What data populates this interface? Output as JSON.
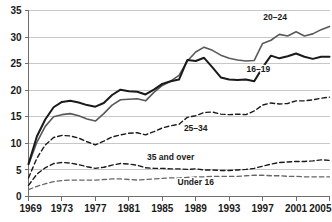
{
  "chart_data": {
    "type": "line",
    "title": "",
    "subtitle": "",
    "xlabel": "",
    "ylabel": "",
    "xlim": [
      1969,
      2005
    ],
    "ylim": [
      0,
      35
    ],
    "ytick_step": 5,
    "xtick_step": 4,
    "grid": true,
    "legend_position": "inline-annotations",
    "yticks": [
      "0",
      "5",
      "10",
      "15",
      "20",
      "25",
      "30",
      "35"
    ],
    "ytick_values": [
      0,
      5,
      10,
      15,
      20,
      25,
      30,
      35
    ],
    "xticks": [
      "1969",
      "1973",
      "1977",
      "1981",
      "1985",
      "1989",
      "1993",
      "1997",
      "2001",
      "2005"
    ],
    "xtick_values": [
      1969,
      1973,
      1977,
      1981,
      1985,
      1989,
      1993,
      1997,
      2001,
      2005
    ],
    "x": [
      1969,
      1970,
      1971,
      1972,
      1973,
      1974,
      1975,
      1976,
      1977,
      1978,
      1979,
      1980,
      1981,
      1982,
      1983,
      1984,
      1985,
      1986,
      1987,
      1988,
      1989,
      1990,
      1991,
      1992,
      1993,
      1994,
      1995,
      1996,
      1997,
      1998,
      1999,
      2000,
      2001,
      2002,
      2003,
      2004,
      2005
    ],
    "series": [
      {
        "name": "20–24",
        "label": "20–24",
        "style": "solid",
        "color": "#595959",
        "width": 1.6,
        "label_x": 1998.5,
        "label_y": 33.3,
        "values": [
          6.0,
          10.2,
          13.2,
          15.0,
          15.4,
          15.6,
          15.2,
          14.6,
          14.2,
          15.6,
          17.2,
          18.2,
          18.3,
          18.4,
          18.0,
          19.6,
          20.9,
          21.7,
          22.8,
          25.5,
          27.2,
          28.1,
          27.5,
          26.6,
          26.0,
          25.7,
          25.5,
          25.6,
          28.8,
          29.4,
          30.5,
          30.2,
          31.0,
          30.2,
          30.6,
          31.4,
          32.0
        ]
      },
      {
        "name": "16–19",
        "label": "16–19",
        "style": "solid",
        "color": "#1a1a1a",
        "width": 2.0,
        "label_x": 1996.5,
        "label_y": 23.4,
        "values": [
          6.1,
          11.3,
          14.5,
          16.8,
          17.8,
          18.0,
          17.7,
          17.2,
          16.9,
          17.6,
          19.1,
          20.1,
          19.8,
          19.7,
          19.2,
          20.1,
          21.2,
          21.7,
          22.0,
          25.7,
          25.5,
          26.1,
          24.3,
          22.4,
          22.0,
          21.9,
          22.0,
          21.7,
          24.3,
          26.5,
          26.0,
          26.4,
          26.9,
          26.3,
          25.9,
          26.3,
          26.3
        ]
      },
      {
        "name": "25–34",
        "label": "25–34",
        "style": "dashed",
        "color": "#1a1a1a",
        "width": 1.4,
        "label_x": 1989.0,
        "label_y": 12.3,
        "values": [
          3.5,
          7.2,
          9.7,
          11.1,
          11.5,
          11.4,
          11.0,
          10.3,
          9.7,
          10.4,
          11.2,
          11.6,
          11.9,
          12.0,
          11.6,
          12.2,
          12.9,
          13.3,
          13.6,
          14.9,
          15.2,
          15.8,
          15.9,
          15.5,
          15.4,
          15.5,
          15.4,
          16.1,
          17.2,
          17.6,
          17.4,
          17.5,
          18.0,
          18.0,
          18.2,
          18.5,
          18.7
        ]
      },
      {
        "name": "35 and over",
        "label": "35 and over",
        "style": "dashed",
        "color": "#1a1a1a",
        "width": 1.4,
        "label_x": 1986.0,
        "label_y": 6.9,
        "values": [
          2.1,
          4.2,
          5.4,
          6.2,
          6.4,
          6.3,
          6.0,
          5.6,
          5.3,
          5.5,
          5.9,
          6.2,
          6.1,
          5.9,
          5.4,
          5.3,
          5.3,
          5.2,
          5.2,
          5.1,
          5.2,
          5.0,
          5.0,
          4.9,
          4.9,
          5.0,
          5.1,
          5.3,
          5.7,
          6.1,
          6.4,
          6.5,
          6.6,
          6.6,
          6.7,
          6.9,
          6.8
        ]
      },
      {
        "name": "Under 16",
        "label": "Under 16",
        "style": "dashed",
        "color": "#666666",
        "width": 1.3,
        "label_x": 1989.0,
        "label_y": 2.2,
        "values": [
          1.3,
          1.9,
          2.4,
          2.8,
          3.0,
          3.1,
          3.1,
          3.1,
          3.1,
          3.2,
          3.3,
          3.3,
          3.2,
          3.1,
          3.2,
          3.3,
          3.4,
          3.5,
          3.5,
          3.6,
          3.7,
          3.7,
          3.8,
          3.8,
          3.8,
          3.8,
          3.9,
          4.0,
          4.0,
          3.9,
          3.9,
          3.8,
          3.8,
          3.7,
          3.7,
          3.7,
          3.7
        ]
      }
    ]
  }
}
